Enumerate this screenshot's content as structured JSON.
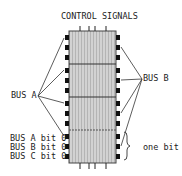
{
  "title": "CONTROL SIGNALS",
  "labels": {
    "bus_a": "BUS A",
    "bus_b": "BUS B",
    "bus_a_bit": "BUS A bit 0",
    "bus_b_bit": "BUS B bit 0",
    "bus_c_bit": "BUS C bit 0",
    "one_bit": "one bit"
  },
  "chip": {
    "slices": 4,
    "fill_color": "#c8c8c8",
    "border_color": "#333333",
    "pin_color": "#111111"
  }
}
